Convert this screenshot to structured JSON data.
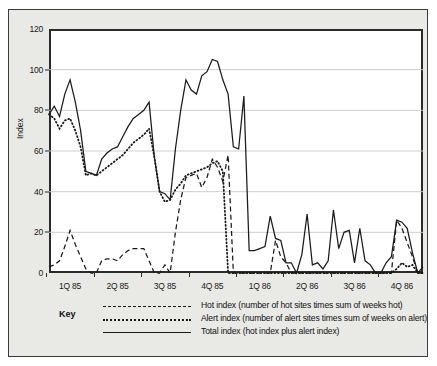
{
  "chart_data": {
    "type": "line",
    "title": "",
    "xlabel": "",
    "ylabel": "Index",
    "ylim": [
      0,
      120
    ],
    "yticks": [
      0,
      20,
      40,
      60,
      80,
      100,
      120
    ],
    "grid": true,
    "legend_position": "below-plot",
    "legend_title": "Key",
    "xtick_labels": [
      "1Q 85",
      "2Q 85",
      "3Q 85",
      "4Q 85",
      "1Q 86",
      "2Q 86",
      "3Q 86",
      "4Q 86"
    ],
    "xtick_positions": [
      4,
      13,
      22,
      31,
      40,
      49,
      58,
      67
    ],
    "x_range": [
      0,
      71
    ],
    "series": [
      {
        "name": "Hot index",
        "description": "number of hot sites times sum of weeks hot",
        "style": "dashed",
        "color": "#1a1a1a",
        "x": [
          0,
          1,
          2,
          3,
          4,
          5,
          6,
          7,
          8,
          9,
          10,
          11,
          12,
          13,
          14,
          15,
          16,
          17,
          18,
          19,
          20,
          21,
          22,
          23,
          24,
          25,
          26,
          27,
          28,
          29,
          30,
          31,
          32,
          33,
          34,
          35,
          36,
          37,
          38,
          39,
          40,
          41,
          42,
          43,
          44,
          45,
          46,
          47,
          48,
          49,
          50,
          51,
          52,
          53,
          54,
          55,
          56,
          57,
          58,
          59,
          60,
          61,
          62,
          63,
          64,
          65,
          66,
          67,
          68,
          69,
          70,
          71
        ],
        "values": [
          3,
          4,
          6,
          13,
          21,
          14,
          8,
          2,
          0,
          0,
          6,
          7,
          7,
          6,
          9,
          11,
          12,
          12,
          12,
          6,
          0,
          0,
          4,
          0,
          20,
          36,
          47,
          48,
          49,
          42,
          47,
          56,
          52,
          45,
          58,
          0,
          0,
          0,
          0,
          0,
          0,
          0,
          0,
          16,
          8,
          5,
          0,
          0,
          0,
          0,
          0,
          0,
          0,
          0,
          0,
          0,
          0,
          0,
          0,
          0,
          0,
          0,
          0,
          0,
          0,
          0,
          26,
          22,
          15,
          8,
          0,
          0
        ]
      },
      {
        "name": "Alert index",
        "description": "number of alert sites times sum of weeks on alert",
        "style": "dotted",
        "color": "#1a1a1a",
        "x": [
          0,
          1,
          2,
          3,
          4,
          5,
          6,
          7,
          8,
          9,
          10,
          11,
          12,
          13,
          14,
          15,
          16,
          17,
          18,
          19,
          20,
          21,
          22,
          23,
          24,
          25,
          26,
          27,
          28,
          29,
          30,
          31,
          32,
          33,
          34,
          35,
          36,
          37,
          38,
          39,
          40,
          41,
          42,
          43,
          44,
          45,
          46,
          47,
          48,
          49,
          50,
          51,
          52,
          53,
          54,
          55,
          56,
          57,
          58,
          59,
          60,
          61,
          62,
          63,
          64,
          65,
          66,
          67,
          68,
          69,
          70,
          71
        ],
        "values": [
          78,
          76,
          71,
          75,
          76,
          70,
          62,
          48,
          49,
          48,
          50,
          52,
          54,
          56,
          58,
          61,
          64,
          66,
          68,
          71,
          57,
          40,
          35,
          36,
          41,
          44,
          48,
          49,
          50,
          51,
          52,
          54,
          55,
          50,
          0,
          0,
          0,
          0,
          0,
          0,
          0,
          0,
          0,
          0,
          0,
          0,
          0,
          0,
          0,
          0,
          0,
          0,
          0,
          0,
          0,
          0,
          0,
          0,
          0,
          0,
          0,
          0,
          0,
          0,
          0,
          0,
          2,
          5,
          3,
          4,
          0,
          0
        ]
      },
      {
        "name": "Total index",
        "description": "hot index plus alert index",
        "style": "solid",
        "color": "#1a1a1a",
        "x": [
          0,
          1,
          2,
          3,
          4,
          5,
          6,
          7,
          8,
          9,
          10,
          11,
          12,
          13,
          14,
          15,
          16,
          17,
          18,
          19,
          20,
          21,
          22,
          23,
          24,
          25,
          26,
          27,
          28,
          29,
          30,
          31,
          32,
          33,
          34,
          35,
          36,
          37,
          38,
          39,
          40,
          41,
          42,
          43,
          44,
          45,
          46,
          47,
          48,
          49,
          50,
          51,
          52,
          53,
          54,
          55,
          56,
          57,
          58,
          59,
          60,
          61,
          62,
          63,
          64,
          65,
          66,
          67,
          68,
          69,
          70,
          71
        ],
        "values": [
          78,
          82,
          77,
          88,
          95,
          84,
          70,
          50,
          49,
          48,
          56,
          59,
          61,
          62,
          67,
          72,
          76,
          78,
          80,
          84,
          57,
          40,
          39,
          36,
          61,
          80,
          95,
          90,
          88,
          97,
          99,
          105,
          104,
          95,
          88,
          62,
          61,
          87,
          11,
          11,
          12,
          13,
          28,
          17,
          16,
          5,
          5,
          0,
          9,
          29,
          4,
          5,
          2,
          6,
          31,
          12,
          20,
          21,
          5,
          22,
          6,
          4,
          0,
          0,
          5,
          8,
          26,
          25,
          22,
          10,
          0,
          3
        ]
      }
    ]
  }
}
